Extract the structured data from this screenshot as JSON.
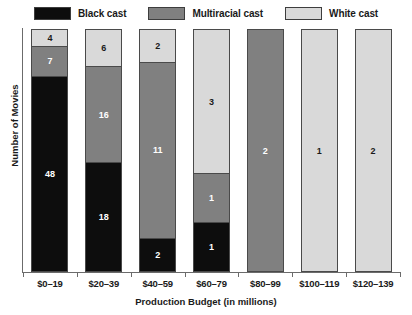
{
  "chart_data": {
    "type": "bar",
    "stacked": true,
    "normalized": true,
    "title": "",
    "xlabel": "Production Budget (in millions)",
    "ylabel": "Number of Movies",
    "grid": false,
    "legend_position": "top",
    "ytick_labels": [],
    "categories": [
      "$0–19",
      "$20–39",
      "$40–59",
      "$60–79",
      "$80–99",
      "$100–119",
      "$120–139"
    ],
    "series": [
      {
        "name": "Black cast",
        "color": "#0d0d0d",
        "label_color": "#ffffff",
        "values": [
          48,
          18,
          2,
          1,
          0,
          0,
          0
        ]
      },
      {
        "name": "Multiracial cast",
        "color": "#808080",
        "label_color": "#ffffff",
        "values": [
          7,
          16,
          11,
          1,
          2,
          0,
          0
        ]
      },
      {
        "name": "White cast",
        "color": "#d9d9d9",
        "label_color": "#1a1a1a",
        "values": [
          4,
          6,
          2,
          3,
          0,
          1,
          2
        ]
      }
    ],
    "totals": [
      59,
      40,
      15,
      5,
      2,
      1,
      2
    ],
    "stack_order_top_to_bottom": [
      "White cast",
      "Multiracial cast",
      "Black cast"
    ]
  },
  "legend": {
    "items": [
      {
        "label": "Black cast",
        "color": "#0d0d0d"
      },
      {
        "label": "Multiracial cast",
        "color": "#808080"
      },
      {
        "label": "White cast",
        "color": "#d9d9d9"
      }
    ]
  },
  "axes": {
    "x_title": "Production Budget (in millions)",
    "y_title": "Number of Movies"
  }
}
